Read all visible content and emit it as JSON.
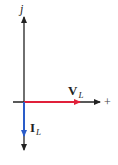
{
  "diagram": {
    "type": "phasor-diagram",
    "axes": {
      "imaginary_label": "j",
      "real_label": "+",
      "axis_color": "#222222"
    },
    "phasors": [
      {
        "name": "V_L",
        "symbol": "V",
        "subscript": "L",
        "direction": "positive-real",
        "color": "#e0203a"
      },
      {
        "name": "I_L",
        "symbol": "I",
        "subscript": "L",
        "direction": "negative-imaginary",
        "color": "#2a5cc8"
      }
    ]
  }
}
